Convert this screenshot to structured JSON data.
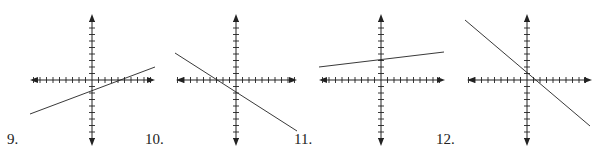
{
  "colors": {
    "ink": "#222222",
    "background": "#ffffff"
  },
  "chart_data": [
    {
      "type": "line",
      "label": "9.",
      "title": "",
      "xlabel": "",
      "ylabel": "",
      "grid": false,
      "axes": {
        "center": [
          92,
          80
        ],
        "x_range_px": [
          30,
          155
        ],
        "y_range_px": [
          14,
          146
        ],
        "ticks_per_half": 9,
        "tick_spacing_px": 6.5
      },
      "line": {
        "from_px": [
          30,
          114
        ],
        "to_px": [
          155,
          67
        ]
      },
      "slope_sign": "positive",
      "description": "Line with positive shallow slope, negative y-intercept, positive x-intercept"
    },
    {
      "type": "line",
      "label": "10.",
      "title": "",
      "xlabel": "",
      "ylabel": "",
      "grid": false,
      "axes": {
        "center": [
          236,
          80
        ],
        "x_range_px": [
          176,
          297
        ],
        "y_range_px": [
          14,
          146
        ],
        "ticks_per_half": 9,
        "tick_spacing_px": 6.5
      },
      "line": {
        "from_px": [
          175,
          53
        ],
        "to_px": [
          297,
          131
        ]
      },
      "slope_sign": "negative",
      "description": "Line with negative slope, negative y-intercept, negative x-intercept"
    },
    {
      "type": "line",
      "label": "11.",
      "title": "",
      "xlabel": "",
      "ylabel": "",
      "grid": false,
      "axes": {
        "center": [
          381,
          80
        ],
        "x_range_px": [
          319,
          445
        ],
        "y_range_px": [
          14,
          146
        ],
        "ticks_per_half": 9,
        "tick_spacing_px": 6.5
      },
      "line": {
        "from_px": [
          319,
          67
        ],
        "to_px": [
          444,
          52
        ]
      },
      "slope_sign": "positive",
      "description": "Nearly horizontal line with small positive slope, positive y-intercept"
    },
    {
      "type": "line",
      "label": "12.",
      "title": "",
      "xlabel": "",
      "ylabel": "",
      "grid": false,
      "axes": {
        "center": [
          527,
          80
        ],
        "x_range_px": [
          467,
          592
        ],
        "y_range_px": [
          14,
          146
        ],
        "ticks_per_half": 9,
        "tick_spacing_px": 6.5
      },
      "line": {
        "from_px": [
          465,
          20
        ],
        "to_px": [
          590,
          126
        ]
      },
      "slope_sign": "negative",
      "description": "Steep negative slope line passing near the origin, small positive y-intercept"
    }
  ],
  "labels": [
    {
      "text": "9.",
      "x": 7,
      "y": 132
    },
    {
      "text": "10.",
      "x": 145,
      "y": 132
    },
    {
      "text": "11.",
      "x": 294,
      "y": 132
    },
    {
      "text": "12.",
      "x": 436,
      "y": 132
    }
  ]
}
